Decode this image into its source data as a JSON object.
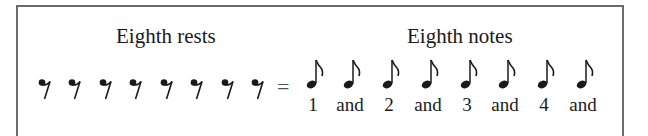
{
  "headings": {
    "rests": "Eighth rests",
    "notes": "Eighth notes"
  },
  "equals": "=",
  "rests": {
    "count": 8,
    "icon": "eighth-rest-icon",
    "x": [
      45,
      75,
      106,
      136,
      167,
      197,
      228,
      258
    ]
  },
  "notes": {
    "icon": "eighth-note-icon",
    "x": [
      313,
      350,
      389,
      428,
      467,
      505,
      544,
      583
    ],
    "labels": [
      "1",
      "and",
      "2",
      "and",
      "3",
      "and",
      "4",
      "and"
    ]
  },
  "colors": {
    "ink": "#1a1a1a",
    "frame": "#6b6b6b",
    "background": "#ffffff"
  }
}
